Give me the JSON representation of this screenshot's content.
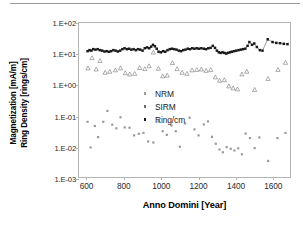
{
  "chart_data": {
    "type": "scatter",
    "title": "",
    "xlabel": "Anno Domini [Year]",
    "ylabel_line1": "Magnetization [mA/m]",
    "ylabel_line2": "Ring Density [rings/cm]",
    "xlim": [
      560,
      1700
    ],
    "ylim_log": [
      -3,
      2
    ],
    "yscale": "log",
    "grid": false,
    "legend_position": "center-right",
    "xticks": [
      600,
      800,
      1000,
      1200,
      1400,
      1600
    ],
    "xtick_labels": [
      "600",
      "800",
      "1000",
      "1200",
      "1400",
      "1600"
    ],
    "yticks": [
      0.001,
      0.01,
      0.1,
      1,
      10,
      100
    ],
    "ytick_labels": [
      "1.E-03",
      "1.E-02",
      "1.E-01",
      "1.E+00",
      "1.E+01",
      "1.E+02"
    ],
    "series": [
      {
        "name": "NRM",
        "marker": "small-square",
        "color": "#9a9a9a",
        "connected": false,
        "points": [
          [
            606,
            0.068
          ],
          [
            622,
            0.0103
          ],
          [
            645,
            0.05
          ],
          [
            662,
            0.022
          ],
          [
            690,
            0.068
          ],
          [
            712,
            0.152
          ],
          [
            738,
            0.055
          ],
          [
            760,
            0.042
          ],
          [
            782,
            0.095
          ],
          [
            805,
            0.045
          ],
          [
            830,
            0.044
          ],
          [
            855,
            0.025
          ],
          [
            880,
            0.028
          ],
          [
            905,
            0.03
          ],
          [
            930,
            0.016
          ],
          [
            958,
            0.0148
          ],
          [
            985,
            0.07
          ],
          [
            1008,
            0.034
          ],
          [
            1030,
            0.026
          ],
          [
            1055,
            0.052
          ],
          [
            1078,
            0.034
          ],
          [
            1100,
            0.0108
          ],
          [
            1128,
            0.06
          ],
          [
            1152,
            0.092
          ],
          [
            1178,
            0.039
          ],
          [
            1200,
            0.025
          ],
          [
            1228,
            0.056
          ],
          [
            1250,
            0.07
          ],
          [
            1272,
            0.0225
          ],
          [
            1292,
            0.0135
          ],
          [
            1312,
            0.0088
          ],
          [
            1330,
            0.0072
          ],
          [
            1350,
            0.0105
          ],
          [
            1372,
            0.0093
          ],
          [
            1392,
            0.0082
          ],
          [
            1412,
            0.0096
          ],
          [
            1432,
            0.0062
          ],
          [
            1452,
            0.0285
          ],
          [
            1475,
            0.0205
          ],
          [
            1500,
            0.0098
          ],
          [
            1525,
            0.0215
          ],
          [
            1572,
            0.0038
          ],
          [
            1622,
            0.0205
          ],
          [
            1665,
            0.03
          ]
        ]
      },
      {
        "name": "SIRM",
        "marker": "open-triangle",
        "color": "#6b6b6b",
        "connected": false,
        "points": [
          [
            608,
            3.6
          ],
          [
            630,
            7.6
          ],
          [
            652,
            3.3
          ],
          [
            672,
            6.2
          ],
          [
            700,
            2.6
          ],
          [
            725,
            2.8
          ],
          [
            755,
            3.1
          ],
          [
            782,
            3.6
          ],
          [
            808,
            2.5
          ],
          [
            832,
            2.3
          ],
          [
            858,
            2.4
          ],
          [
            885,
            3.7
          ],
          [
            912,
            3.4
          ],
          [
            935,
            4.2
          ],
          [
            958,
            11.5
          ],
          [
            985,
            3.5
          ],
          [
            1008,
            2.0
          ],
          [
            1032,
            2.1
          ],
          [
            1060,
            5.3
          ],
          [
            1085,
            3.4
          ],
          [
            1112,
            2.6
          ],
          [
            1138,
            2.4
          ],
          [
            1165,
            3.1
          ],
          [
            1190,
            3.2
          ],
          [
            1215,
            3.3
          ],
          [
            1240,
            3.0
          ],
          [
            1265,
            3.2
          ],
          [
            1290,
            1.85
          ],
          [
            1312,
            1.45
          ],
          [
            1338,
            1.5
          ],
          [
            1362,
            0.95
          ],
          [
            1385,
            0.82
          ],
          [
            1408,
            0.76
          ],
          [
            1432,
            2.3
          ],
          [
            1458,
            2.8
          ],
          [
            1500,
            0.73
          ],
          [
            1572,
            1.65
          ],
          [
            1625,
            3.2
          ],
          [
            1665,
            5.4
          ]
        ]
      },
      {
        "name": "Ring/cm",
        "marker": "filled-square",
        "color": "#1a1a1a",
        "connected": true,
        "points": [
          [
            606,
            12.5
          ],
          [
            616,
            13.5
          ],
          [
            626,
            13.0
          ],
          [
            636,
            14.5
          ],
          [
            648,
            14.0
          ],
          [
            660,
            14.5
          ],
          [
            672,
            13.5
          ],
          [
            684,
            13.0
          ],
          [
            696,
            12.2
          ],
          [
            708,
            12.5
          ],
          [
            720,
            12.0
          ],
          [
            732,
            12.5
          ],
          [
            744,
            13.5
          ],
          [
            756,
            13.0
          ],
          [
            768,
            12.2
          ],
          [
            780,
            13.0
          ],
          [
            792,
            14.5
          ],
          [
            804,
            15.5
          ],
          [
            816,
            14.5
          ],
          [
            828,
            15.0
          ],
          [
            840,
            14.0
          ],
          [
            852,
            14.5
          ],
          [
            864,
            13.5
          ],
          [
            876,
            14.5
          ],
          [
            888,
            14.0
          ],
          [
            900,
            13.0
          ],
          [
            912,
            15.5
          ],
          [
            924,
            16.5
          ],
          [
            936,
            15.5
          ],
          [
            946,
            17.5
          ],
          [
            956,
            20.0
          ],
          [
            966,
            18.0
          ],
          [
            976,
            15.0
          ],
          [
            986,
            12.0
          ],
          [
            998,
            11.5
          ],
          [
            1010,
            12.5
          ],
          [
            1022,
            12.0
          ],
          [
            1034,
            13.5
          ],
          [
            1046,
            14.5
          ],
          [
            1058,
            15.0
          ],
          [
            1070,
            14.5
          ],
          [
            1082,
            14.0
          ],
          [
            1094,
            13.0
          ],
          [
            1106,
            12.5
          ],
          [
            1118,
            13.5
          ],
          [
            1130,
            14.0
          ],
          [
            1142,
            15.0
          ],
          [
            1154,
            14.5
          ],
          [
            1166,
            15.5
          ],
          [
            1178,
            15.0
          ],
          [
            1190,
            15.5
          ],
          [
            1202,
            15.0
          ],
          [
            1215,
            15.5
          ],
          [
            1228,
            15.0
          ],
          [
            1240,
            14.5
          ],
          [
            1252,
            15.5
          ],
          [
            1264,
            16.0
          ],
          [
            1276,
            18.5
          ],
          [
            1288,
            16.0
          ],
          [
            1298,
            13.0
          ],
          [
            1308,
            11.5
          ],
          [
            1318,
            11.0
          ],
          [
            1328,
            11.5
          ],
          [
            1338,
            11.0
          ],
          [
            1348,
            10.5
          ],
          [
            1358,
            11.0
          ],
          [
            1368,
            11.5
          ],
          [
            1378,
            12.0
          ],
          [
            1390,
            12.5
          ],
          [
            1402,
            13.0
          ],
          [
            1414,
            13.5
          ],
          [
            1426,
            14.0
          ],
          [
            1438,
            14.5
          ],
          [
            1450,
            15.0
          ],
          [
            1462,
            18.5
          ],
          [
            1472,
            24.5
          ],
          [
            1486,
            20.0
          ],
          [
            1498,
            22.0
          ],
          [
            1512,
            17.0
          ],
          [
            1528,
            13.5
          ],
          [
            1542,
            13.0
          ],
          [
            1570,
            30.0
          ],
          [
            1596,
            24.5
          ],
          [
            1616,
            23.0
          ],
          [
            1636,
            22.5
          ],
          [
            1656,
            21.5
          ],
          [
            1676,
            21.0
          ]
        ]
      }
    ]
  },
  "legend": {
    "items": [
      {
        "label": "NRM"
      },
      {
        "label": "SIRM"
      },
      {
        "label": "Ring/cm"
      }
    ]
  }
}
